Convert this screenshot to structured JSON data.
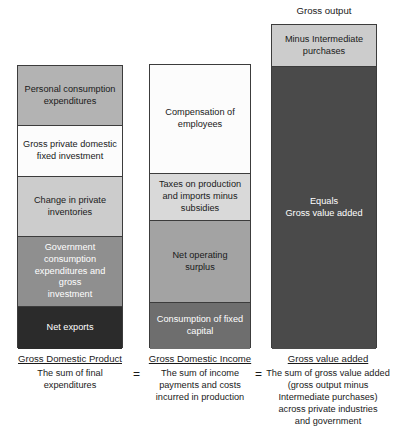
{
  "diagram": {
    "title_top": "Gross output",
    "equals_symbols": [
      "=",
      "="
    ],
    "columns": [
      {
        "id": "gdp",
        "caption_title": "Gross Domestic Product",
        "caption_body": "The sum of final\nexpenditures",
        "segments": [
          {
            "label": "Personal consumption\nexpenditures",
            "color": "#b3b3b3",
            "text_color": "#1a1a1a",
            "height_px": 60
          },
          {
            "label": "Gross private domestic\nfixed investment",
            "color": "#fcfcfc",
            "text_color": "#1a1a1a",
            "height_px": 51
          },
          {
            "label": "Change in private\ninventories",
            "color": "#cccccc",
            "text_color": "#1a1a1a",
            "height_px": 60
          },
          {
            "label": "Government\nconsumption\nexpenditures and gross\ninvestment",
            "color": "#8f8f8f",
            "text_color": "#ffffff",
            "height_px": 70
          },
          {
            "label": "Net exports",
            "color": "#2b2b2b",
            "text_color": "#ffffff",
            "height_px": 42
          }
        ]
      },
      {
        "id": "gdi",
        "caption_title": "Gross Domestic Income",
        "caption_body": "The sum of income\npayments and costs\nincurred in production",
        "segments": [
          {
            "label": "Compensation of\nemployees",
            "color": "#fcfcfc",
            "text_color": "#1a1a1a",
            "height_px": 109
          },
          {
            "label": "Taxes on production\nand imports minus\nsubsidies",
            "color": "#d9d9d9",
            "text_color": "#1a1a1a",
            "height_px": 47
          },
          {
            "label": "Net operating\nsurplus",
            "color": "#a3a3a3",
            "text_color": "#1a1a1a",
            "height_px": 82
          },
          {
            "label": "Consumption of fixed\ncapital",
            "color": "#6e6e6e",
            "text_color": "#ffffff",
            "height_px": 46
          }
        ]
      },
      {
        "id": "gva",
        "caption_title": "Gross value added",
        "caption_body": "The sum of gross value added\n(gross output minus\nIntermediate purchases)\nacross private industries\nand government",
        "segments": [
          {
            "label": "Minus Intermediate\npurchases",
            "color": "#cccccc",
            "text_color": "#1a1a1a",
            "height_px": 42
          },
          {
            "label": "Equals\nGross value added",
            "color": "#4a4a4a",
            "text_color": "#ffffff",
            "height_px": 282
          }
        ]
      }
    ]
  },
  "colors": {
    "outline": "#3c3c3c",
    "background": "#ffffff",
    "text": "#1a1a1a",
    "text_inverse": "#ffffff"
  }
}
